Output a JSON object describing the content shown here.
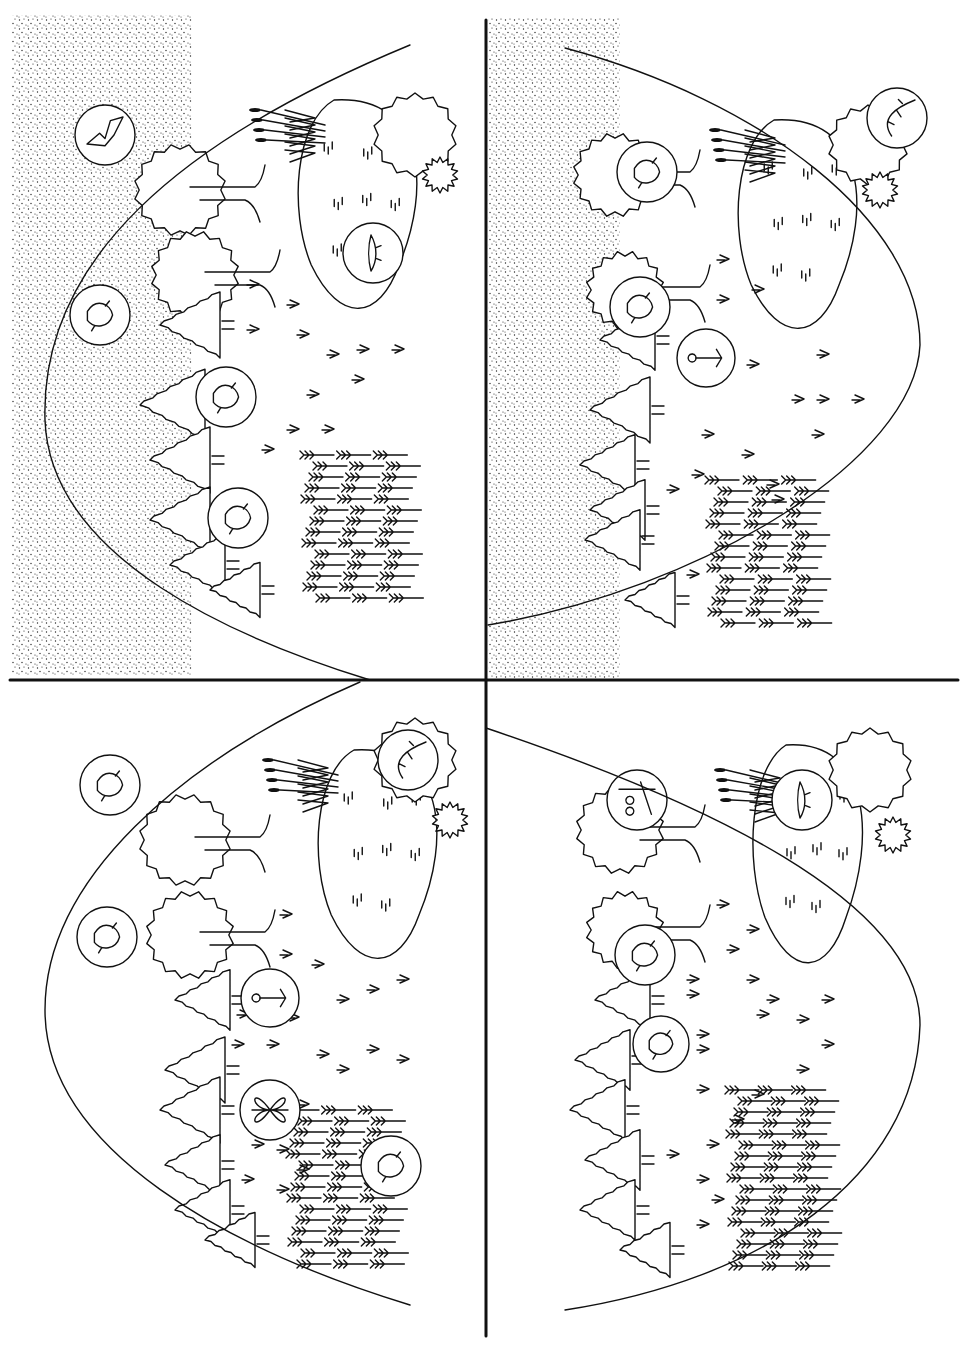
{
  "figure": {
    "type": "ecological-landscape-diagram",
    "layout": "four-quadrants",
    "colors": {
      "ink": "#111111",
      "background": "#ffffff",
      "stipple": "#222222"
    },
    "axes": {
      "horizontal_y": 680,
      "vertical_x": 486,
      "horizontal_x_range": [
        10,
        958
      ],
      "vertical_y_range": [
        20,
        1336
      ]
    },
    "quadrants": [
      {
        "id": "top-left",
        "stipple_rect": [
          12,
          15,
          180,
          660
        ],
        "curve": "M410,45 C180,140 40,260 45,420 C50,560 240,640 370,680",
        "lake": {
          "cx": 360,
          "cy": 210,
          "rx": 65,
          "ry": 110
        },
        "bushes": [
          [
            415,
            135,
            38
          ],
          [
            440,
            175,
            14
          ]
        ],
        "deciduous_trees": [
          [
            180,
            190,
            42
          ],
          [
            195,
            275,
            40
          ]
        ],
        "conifers": [
          [
            160,
            325,
            60
          ],
          [
            140,
            405,
            65
          ],
          [
            150,
            460,
            60
          ],
          [
            150,
            520,
            60
          ],
          [
            170,
            565,
            55
          ],
          [
            210,
            590,
            50
          ]
        ],
        "reeds": [
          255,
          110
        ],
        "grass_field": [
          310,
          455,
          110,
          150
        ],
        "arrow_marks": [
          [
            250,
            285
          ],
          [
            290,
            305
          ],
          [
            300,
            335
          ],
          [
            250,
            330
          ],
          [
            330,
            355
          ],
          [
            360,
            350
          ],
          [
            395,
            350
          ],
          [
            310,
            395
          ],
          [
            325,
            430
          ],
          [
            290,
            430
          ],
          [
            265,
            450
          ],
          [
            355,
            380
          ]
        ],
        "circles": [
          {
            "cx": 105,
            "cy": 135,
            "r": 30,
            "animal": "bat-icon"
          },
          {
            "cx": 100,
            "cy": 315,
            "r": 30,
            "animal": "bird-eagle-icon"
          },
          {
            "cx": 226,
            "cy": 397,
            "r": 30,
            "animal": "squirrel-icon"
          },
          {
            "cx": 238,
            "cy": 518,
            "r": 30,
            "animal": "rodent-icon"
          },
          {
            "cx": 373,
            "cy": 253,
            "r": 30,
            "animal": "fish-icon"
          }
        ]
      },
      {
        "id": "top-right",
        "stipple_rect": [
          488,
          18,
          132,
          660
        ],
        "curve": "M565,48 C760,100 920,220 920,345 C915,460 700,590 488,625",
        "lake": {
          "cx": 800,
          "cy": 230,
          "rx": 65,
          "ry": 110
        },
        "bushes": [
          [
            868,
            145,
            36
          ],
          [
            880,
            190,
            14
          ]
        ],
        "deciduous_trees": [
          [
            615,
            175,
            38
          ],
          [
            625,
            290,
            35
          ]
        ],
        "conifers": [
          [
            600,
            340,
            55
          ],
          [
            590,
            410,
            60
          ],
          [
            580,
            465,
            55
          ],
          [
            590,
            510,
            55
          ],
          [
            585,
            540,
            55
          ],
          [
            625,
            600,
            50
          ]
        ],
        "reeds": [
          715,
          130
        ],
        "grass_field": [
          715,
          480,
          115,
          150
        ],
        "arrow_marks": [
          [
            720,
            260
          ],
          [
            755,
            290
          ],
          [
            720,
            300
          ],
          [
            820,
            355
          ],
          [
            750,
            365
          ],
          [
            795,
            400
          ],
          [
            820,
            400
          ],
          [
            855,
            400
          ],
          [
            705,
            435
          ],
          [
            815,
            435
          ],
          [
            745,
            455
          ],
          [
            695,
            475
          ],
          [
            770,
            485
          ],
          [
            670,
            490
          ],
          [
            775,
            500
          ],
          [
            690,
            575
          ]
        ],
        "circles": [
          {
            "cx": 897,
            "cy": 118,
            "r": 30,
            "animal": "lizard-icon"
          },
          {
            "cx": 647,
            "cy": 172,
            "r": 30,
            "animal": "frog-icon"
          },
          {
            "cx": 640,
            "cy": 307,
            "r": 30,
            "animal": "frog-on-branch-icon"
          },
          {
            "cx": 706,
            "cy": 358,
            "r": 29,
            "animal": "flower-icon"
          }
        ]
      },
      {
        "id": "bottom-left",
        "stipple_rect": null,
        "curve": "M360,682 C180,760 45,880 45,1010 C45,1150 230,1250 410,1305",
        "lake": {
          "cx": 380,
          "cy": 860,
          "rx": 65,
          "ry": 110
        },
        "bushes": [
          [
            415,
            760,
            38
          ],
          [
            450,
            820,
            14
          ]
        ],
        "deciduous_trees": [
          [
            185,
            840,
            42
          ],
          [
            190,
            935,
            40
          ]
        ],
        "conifers": [
          [
            175,
            1000,
            55
          ],
          [
            165,
            1070,
            60
          ],
          [
            160,
            1110,
            60
          ],
          [
            165,
            1165,
            55
          ],
          [
            175,
            1210,
            55
          ],
          [
            205,
            1240,
            50
          ]
        ],
        "reeds": [
          268,
          760
        ],
        "grass_field": [
          295,
          1110,
          110,
          165
        ],
        "arrow_marks": [
          [
            283,
            915
          ],
          [
            283,
            955
          ],
          [
            315,
            965
          ],
          [
            290,
            1018
          ],
          [
            340,
            1000
          ],
          [
            370,
            990
          ],
          [
            400,
            980
          ],
          [
            240,
            1015
          ],
          [
            235,
            1045
          ],
          [
            270,
            1045
          ],
          [
            320,
            1055
          ],
          [
            370,
            1050
          ],
          [
            400,
            1060
          ],
          [
            340,
            1070
          ],
          [
            300,
            1105
          ],
          [
            255,
            1145
          ],
          [
            280,
            1150
          ],
          [
            300,
            1170
          ],
          [
            245,
            1180
          ],
          [
            280,
            1190
          ]
        ],
        "circles": [
          {
            "cx": 110,
            "cy": 785,
            "r": 30,
            "animal": "bird-diving-icon"
          },
          {
            "cx": 107,
            "cy": 937,
            "r": 30,
            "animal": "bird-soaring-icon"
          },
          {
            "cx": 270,
            "cy": 998,
            "r": 29,
            "animal": "flower-icon"
          },
          {
            "cx": 270,
            "cy": 1110,
            "r": 30,
            "animal": "butterfly-icon"
          },
          {
            "cx": 391,
            "cy": 1166,
            "r": 30,
            "animal": "mouse-icon"
          },
          {
            "cx": 408,
            "cy": 760,
            "r": 30,
            "animal": "lizard-icon"
          }
        ]
      },
      {
        "id": "bottom-right",
        "stipple_rect": null,
        "curve": "M486,728 C700,800 920,900 920,1025 C915,1180 760,1280 565,1310",
        "lake": {
          "cx": 810,
          "cy": 860,
          "rx": 60,
          "ry": 115
        },
        "bushes": [
          [
            870,
            770,
            38
          ],
          [
            893,
            835,
            14
          ]
        ],
        "deciduous_trees": [
          [
            620,
            830,
            40
          ],
          [
            625,
            930,
            35
          ]
        ],
        "conifers": [
          [
            595,
            1000,
            55
          ],
          [
            575,
            1060,
            55
          ],
          [
            570,
            1110,
            55
          ],
          [
            585,
            1160,
            55
          ],
          [
            580,
            1210,
            55
          ],
          [
            620,
            1250,
            50
          ]
        ],
        "reeds": [
          720,
          770
        ],
        "grass_field": [
          735,
          1090,
          100,
          185
        ],
        "arrow_marks": [
          [
            720,
            905
          ],
          [
            750,
            930
          ],
          [
            730,
            950
          ],
          [
            690,
            980
          ],
          [
            750,
            980
          ],
          [
            770,
            1000
          ],
          [
            825,
            1000
          ],
          [
            690,
            995
          ],
          [
            760,
            1015
          ],
          [
            700,
            1035
          ],
          [
            800,
            1020
          ],
          [
            825,
            1045
          ],
          [
            700,
            1050
          ],
          [
            700,
            1090
          ],
          [
            800,
            1070
          ],
          [
            755,
            1095
          ],
          [
            735,
            1120
          ],
          [
            670,
            1155
          ],
          [
            710,
            1145
          ],
          [
            700,
            1180
          ],
          [
            700,
            1225
          ],
          [
            715,
            1200
          ]
        ],
        "circles": [
          {
            "cx": 637,
            "cy": 800,
            "r": 30,
            "animal": "owl-icon"
          },
          {
            "cx": 802,
            "cy": 800,
            "r": 30,
            "animal": "fish-icon"
          },
          {
            "cx": 645,
            "cy": 955,
            "r": 30,
            "animal": "bird-perched-icon"
          },
          {
            "cx": 661,
            "cy": 1044,
            "r": 28,
            "animal": "bird-chick-icon"
          }
        ]
      }
    ]
  }
}
